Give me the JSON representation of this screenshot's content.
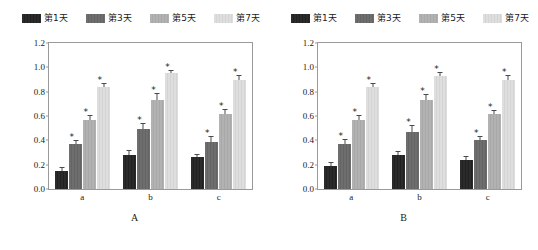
{
  "figure": {
    "background": "#ffffff",
    "axis_color": "#9a9a9a"
  },
  "series_colors": [
    "#2b2b2b",
    "#6e6e6e",
    "#b2b2b2",
    "#dedede"
  ],
  "legend": {
    "entries": [
      {
        "label": "第1天",
        "color": "#2b2b2b"
      },
      {
        "label": "第3天",
        "color": "#6e6e6e"
      },
      {
        "label": "第5天",
        "color": "#b2b2b2"
      },
      {
        "label": "第7天",
        "color": "#dedede"
      }
    ]
  },
  "axis": {
    "ylabel": "MTT吸光度指数(680 nm)",
    "yticks": [
      "1.2",
      "1.0",
      "0.8",
      "0.6",
      "0.4",
      "0.2",
      "0.0"
    ],
    "xcategories": [
      "a",
      "b",
      "c"
    ]
  },
  "panels": [
    {
      "id": "panel-a",
      "label": "A"
    },
    {
      "id": "panel-b",
      "label": "B"
    }
  ],
  "chart_data": [
    {
      "type": "bar",
      "title": "A",
      "panel": "A",
      "xlabel": "",
      "ylabel": "MTT吸光度指数(680 nm)",
      "ylim": [
        0,
        1.2
      ],
      "yticks": [
        0.0,
        0.2,
        0.4,
        0.6,
        0.8,
        1.0,
        1.2
      ],
      "grid": false,
      "legend_position": "top",
      "categories": [
        "a",
        "b",
        "c"
      ],
      "series": [
        {
          "name": "第1天",
          "color": "#2b2b2b",
          "values": [
            0.15,
            0.28,
            0.26
          ],
          "errors": [
            0.025,
            0.03,
            0.02
          ],
          "significance": [
            "",
            "",
            ""
          ]
        },
        {
          "name": "第3天",
          "color": "#6e6e6e",
          "values": [
            0.37,
            0.49,
            0.39
          ],
          "errors": [
            0.025,
            0.04,
            0.035
          ],
          "significance": [
            "*",
            "*",
            "*"
          ]
        },
        {
          "name": "第5天",
          "color": "#b2b2b2",
          "values": [
            0.57,
            0.73,
            0.62
          ],
          "errors": [
            0.03,
            0.05,
            0.03
          ],
          "significance": [
            "*",
            "*",
            "*"
          ]
        },
        {
          "name": "第7天",
          "color": "#dedede",
          "values": [
            0.84,
            0.95,
            0.9
          ],
          "errors": [
            0.025,
            0.02,
            0.03
          ],
          "significance": [
            "*",
            "*",
            "*"
          ]
        }
      ]
    },
    {
      "type": "bar",
      "title": "B",
      "panel": "B",
      "xlabel": "",
      "ylabel": "MTT吸光度指数(680 nm)",
      "ylim": [
        0,
        1.2
      ],
      "yticks": [
        0.0,
        0.2,
        0.4,
        0.6,
        0.8,
        1.0,
        1.2
      ],
      "grid": false,
      "legend_position": "top",
      "categories": [
        "a",
        "b",
        "c"
      ],
      "series": [
        {
          "name": "第1天",
          "color": "#2b2b2b",
          "values": [
            0.19,
            0.28,
            0.24
          ],
          "errors": [
            0.025,
            0.025,
            0.025
          ],
          "significance": [
            "",
            "",
            ""
          ]
        },
        {
          "name": "第3天",
          "color": "#6e6e6e",
          "values": [
            0.37,
            0.47,
            0.4
          ],
          "errors": [
            0.03,
            0.045,
            0.03
          ],
          "significance": [
            "*",
            "*",
            "*"
          ]
        },
        {
          "name": "第5天",
          "color": "#b2b2b2",
          "values": [
            0.57,
            0.73,
            0.62
          ],
          "errors": [
            0.03,
            0.04,
            0.02
          ],
          "significance": [
            "*",
            "*",
            "*"
          ]
        },
        {
          "name": "第7天",
          "color": "#dedede",
          "values": [
            0.84,
            0.93,
            0.9
          ],
          "errors": [
            0.025,
            0.02,
            0.03
          ],
          "significance": [
            "*",
            "*",
            "*"
          ]
        }
      ]
    }
  ]
}
